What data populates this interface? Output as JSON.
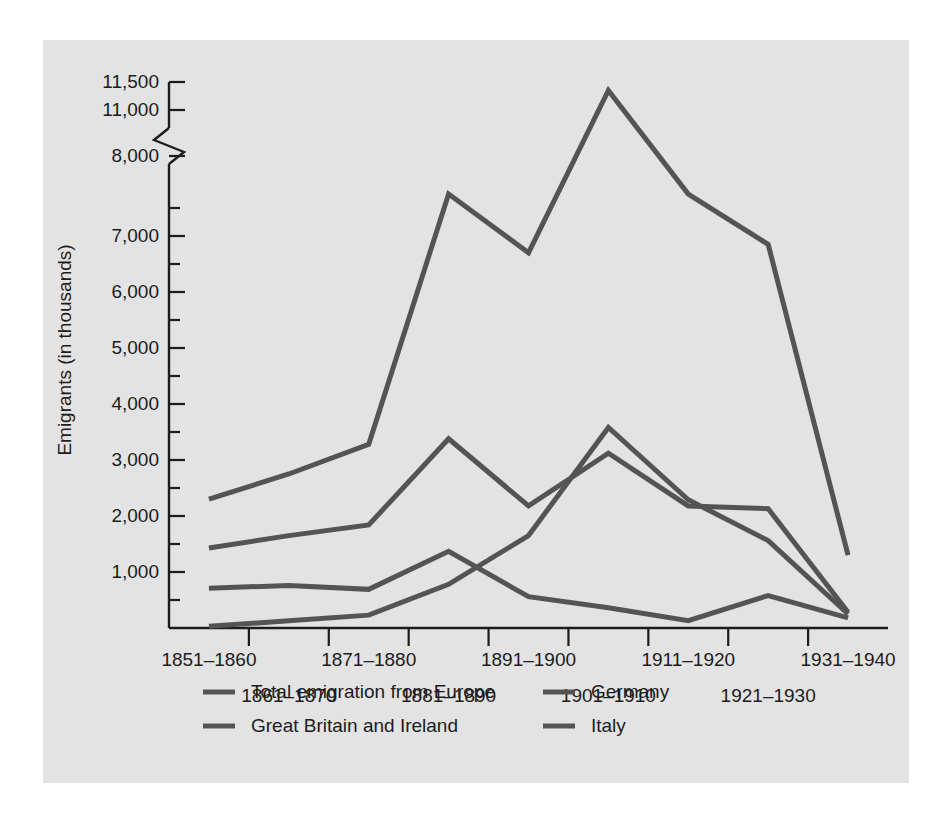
{
  "figure": {
    "panel_background": "#e3e3e3",
    "page_background": "#ffffff",
    "line_color": "#545454",
    "text_color": "#1c1c1c"
  },
  "chart_data": {
    "type": "line",
    "title": "",
    "xlabel": "",
    "ylabel": "Emigrants (in thousands)",
    "grid": false,
    "legend_position": "bottom",
    "axis_break": {
      "present": true,
      "between": [
        11000,
        8000
      ],
      "note": "broken y-axis between 11,000 and 8,000"
    },
    "ylim": [
      0,
      11500
    ],
    "ytick_labels": [
      "11,500",
      "11,000",
      "8,000",
      "7,000",
      "6,000",
      "5,000",
      "4,000",
      "3,000",
      "2,000",
      "1,000"
    ],
    "yticks_major": [
      11500,
      11000,
      8000,
      7000,
      6000,
      5000,
      4000,
      3000,
      2000,
      1000
    ],
    "yticks_minor": [
      7500,
      6500,
      5500,
      4500,
      3500,
      2500,
      1500,
      500
    ],
    "categories": [
      "1851–1860",
      "1861–1870",
      "1871–1880",
      "1881–1890",
      "1891–1900",
      "1901–1910",
      "1911–1920",
      "1921–1930",
      "1931–1940"
    ],
    "series": [
      {
        "name": "Total emigration from Europe",
        "values": [
          2300,
          2750,
          3280,
          7750,
          6700,
          11350,
          7750,
          6850,
          1300
        ]
      },
      {
        "name": "Great Britain and Ireland",
        "values": [
          1430,
          1650,
          1840,
          3380,
          2180,
          3120,
          2180,
          2130,
          280
        ]
      },
      {
        "name": "Germany",
        "values": [
          710,
          760,
          690,
          1370,
          560,
          360,
          130,
          580,
          180
        ]
      },
      {
        "name": "Italy",
        "values": [
          30,
          130,
          230,
          780,
          1650,
          3580,
          2290,
          1560,
          250
        ]
      }
    ]
  },
  "legend": {
    "entries": [
      {
        "label": "Total emigration from Europe"
      },
      {
        "label": "Germany"
      },
      {
        "label": "Great Britain and Ireland"
      },
      {
        "label": "Italy"
      }
    ]
  }
}
